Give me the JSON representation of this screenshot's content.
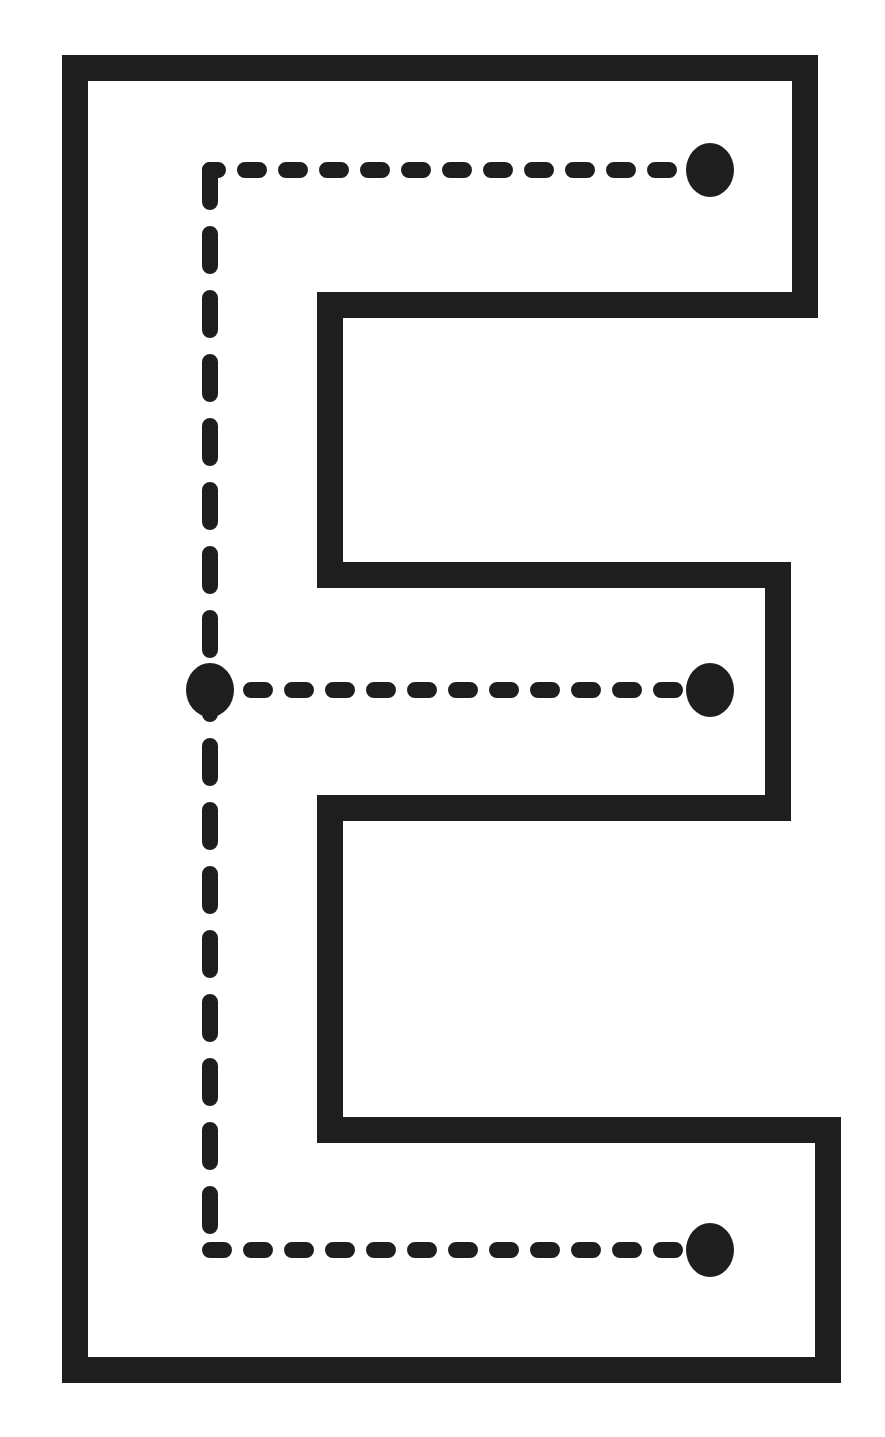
{
  "worksheet": {
    "letter": "E",
    "type": "letter-tracing",
    "ink_color": "#1e1e1e",
    "background_color": "#ffffff",
    "outline": {
      "stroke_width": 26,
      "points": [
        [
          75,
          68
        ],
        [
          805,
          68
        ],
        [
          805,
          305
        ],
        [
          330,
          305
        ],
        [
          330,
          575
        ],
        [
          778,
          575
        ],
        [
          778,
          808
        ],
        [
          330,
          808
        ],
        [
          330,
          1130
        ],
        [
          828,
          1130
        ],
        [
          828,
          1370
        ],
        [
          75,
          1370
        ]
      ]
    },
    "tracing_strokes": [
      {
        "id": "top-arm",
        "start": [
          710,
          170
        ],
        "end": [
          210,
          170
        ],
        "corner": [
          210,
          170
        ],
        "direction": "right-to-left"
      },
      {
        "id": "spine",
        "start": [
          210,
          170
        ],
        "end": [
          210,
          1250
        ],
        "direction": "top-to-bottom"
      },
      {
        "id": "middle-arm",
        "start": [
          210,
          690
        ],
        "end": [
          710,
          690
        ],
        "direction": "left-to-right"
      },
      {
        "id": "bottom-arm",
        "start": [
          210,
          1250
        ],
        "end": [
          710,
          1250
        ],
        "direction": "left-to-right"
      }
    ],
    "start_dots": [
      {
        "id": "dot-top-right",
        "cx": 710,
        "cy": 170
      },
      {
        "id": "dot-middle-left",
        "cx": 210,
        "cy": 690
      },
      {
        "id": "dot-middle-right",
        "cx": 710,
        "cy": 690
      },
      {
        "id": "dot-bottom-right",
        "cx": 710,
        "cy": 1250
      }
    ]
  }
}
